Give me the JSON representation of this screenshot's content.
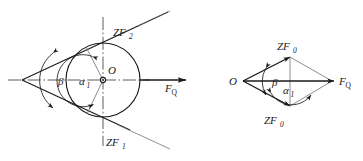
{
  "figure": {
    "background_color": "#ffffff",
    "line_color": "#1a1a1a",
    "thin_line_color": "#5a5a5a"
  },
  "left_diagram": {
    "name": "cone-circle-tangent-construction",
    "labels": {
      "center_point": "O",
      "angle_beta": "β",
      "angle_alpha": "α",
      "angle_alpha_sub": "1",
      "force_q": "F",
      "force_q_sub": "Q",
      "tangent_upper": "ZF",
      "tangent_upper_sub": "2",
      "tangent_lower": "ZF",
      "tangent_lower_sub": "1"
    },
    "geometry": {
      "apex_x": 22,
      "apex_y": 80,
      "center_x": 103,
      "center_y": 80,
      "radius": 37,
      "axis_y": 80,
      "force_arrow_end_x": 186
    }
  },
  "right_diagram": {
    "name": "force-rhombus",
    "labels": {
      "origin_point": "O",
      "angle_beta": "β",
      "angle_alpha": "α",
      "angle_alpha_sub": "1",
      "force_q": "F",
      "force_q_sub": "Q",
      "vertex_top": "ZF",
      "vertex_top_sub": "0",
      "vertex_bottom": "ZF",
      "vertex_bottom_sub": "0"
    },
    "geometry": {
      "left_x": 243,
      "right_x": 330,
      "center_y": 81,
      "top_x": 290,
      "top_y": 57,
      "bottom_x": 290,
      "bottom_y": 106
    }
  }
}
